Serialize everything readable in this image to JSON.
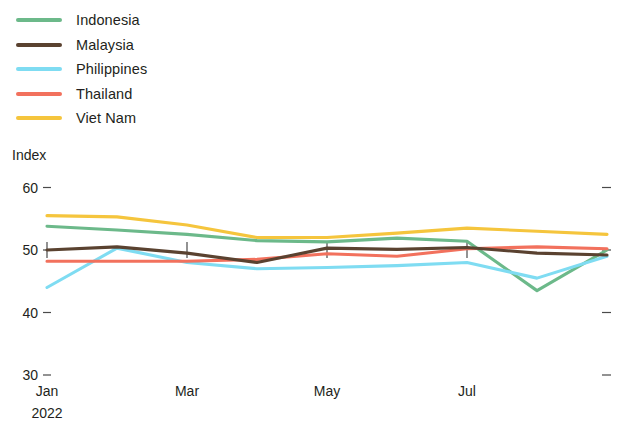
{
  "legend": {
    "position": "top-left",
    "items": [
      {
        "label": "Indonesia",
        "color": "#6cb98a",
        "swatch_name": "legend-swatch-indonesia"
      },
      {
        "label": "Malaysia",
        "color": "#5a4230",
        "swatch_name": "legend-swatch-malaysia"
      },
      {
        "label": "Philippines",
        "color": "#7fdcf2",
        "swatch_name": "legend-swatch-philippines"
      },
      {
        "label": "Thailand",
        "color": "#f2715d",
        "swatch_name": "legend-swatch-thailand"
      },
      {
        "label": "Viet Nam",
        "color": "#f5c53d",
        "swatch_name": "legend-swatch-vietnam"
      }
    ]
  },
  "axis": {
    "y_title": "Index",
    "y_ticks": [
      "60",
      "50",
      "40",
      "30"
    ],
    "x_ticks": [
      "Jan",
      "Mar",
      "May",
      "Jul"
    ],
    "x_sub": "2022"
  },
  "chart_data": {
    "type": "line",
    "title": "",
    "subtitle": "",
    "xlabel": "",
    "ylabel": "Index",
    "ylim": [
      30,
      60
    ],
    "yticks": [
      30,
      40,
      50,
      60
    ],
    "grid": false,
    "legend_position": "top-left",
    "x": [
      "Jan",
      "Feb",
      "Mar",
      "Apr",
      "May",
      "Jun",
      "Jul",
      "Aug",
      "Sep"
    ],
    "x_labeled": [
      "Jan",
      "Mar",
      "May",
      "Jul"
    ],
    "x_sub_label": "2022",
    "series": [
      {
        "name": "Indonesia",
        "color": "#6cb98a",
        "values": [
          53.8,
          53.2,
          52.5,
          51.5,
          51.3,
          51.9,
          51.4,
          43.5,
          50.0
        ]
      },
      {
        "name": "Malaysia",
        "color": "#5a4230",
        "values": [
          50.0,
          50.5,
          49.5,
          48.0,
          50.3,
          50.1,
          50.4,
          49.5,
          49.2
        ]
      },
      {
        "name": "Philippines",
        "color": "#7fdcf2",
        "values": [
          44.0,
          50.3,
          48.0,
          47.0,
          47.2,
          47.5,
          48.0,
          45.5,
          49.0
        ]
      },
      {
        "name": "Thailand",
        "color": "#f2715d",
        "values": [
          48.2,
          48.2,
          48.2,
          48.5,
          49.4,
          49.0,
          50.2,
          50.5,
          50.2
        ]
      },
      {
        "name": "Viet Nam",
        "color": "#f5c53d",
        "values": [
          55.5,
          55.3,
          54.0,
          52.0,
          52.0,
          52.7,
          53.5,
          53.0,
          52.5
        ]
      }
    ]
  }
}
